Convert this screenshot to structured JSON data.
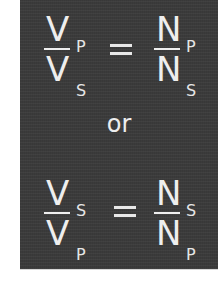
{
  "panel": {
    "background_color": "#3b3b3b",
    "text_color": "#eeeeee"
  },
  "equation_top": {
    "left": {
      "numerator": "V",
      "numerator_sub": "P",
      "denominator": "V",
      "denominator_sub": "S"
    },
    "operator": "=",
    "right": {
      "numerator": "N",
      "numerator_sub": "P",
      "denominator": "N",
      "denominator_sub": "S"
    }
  },
  "connector": "or",
  "equation_bottom": {
    "left": {
      "numerator": "V",
      "numerator_sub": "S",
      "denominator": "V",
      "denominator_sub": "P"
    },
    "operator": "=",
    "right": {
      "numerator": "N",
      "numerator_sub": "S",
      "denominator": "N",
      "denominator_sub": "P"
    }
  }
}
